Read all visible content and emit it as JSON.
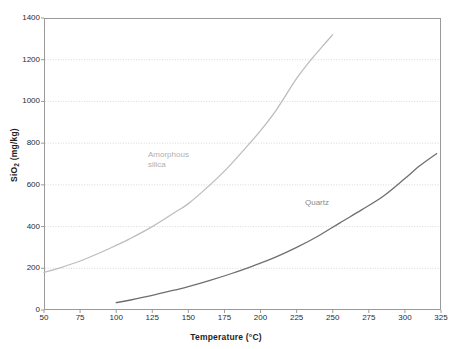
{
  "chart_data": {
    "type": "line",
    "title": "",
    "xlabel": "Temperature (°C)",
    "ylabel": "SiO2 (mg/kg)",
    "ylabel_base": "SiO",
    "ylabel_sub": "2",
    "ylabel_units": " (mg/kg)",
    "xlim": [
      50,
      325
    ],
    "ylim": [
      0,
      1400
    ],
    "xticks": [
      50,
      75,
      100,
      125,
      150,
      175,
      200,
      225,
      250,
      275,
      300,
      325
    ],
    "yticks": [
      0,
      200,
      400,
      600,
      800,
      1000,
      1200,
      1400
    ],
    "grid": "horizontal-dotted",
    "legend": "inline-annotations",
    "series": [
      {
        "name": "Amorphous silica",
        "label_text": "Amorphous\nsilica",
        "color": "#bdbdbd",
        "x": [
          50,
          60,
          75,
          90,
          100,
          109,
          125,
          141,
          150,
          165,
          177,
          190,
          200,
          211,
          225,
          235,
          243,
          250
        ],
        "y": [
          180,
          200,
          235,
          278,
          310,
          340,
          400,
          470,
          510,
          600,
          680,
          780,
          860,
          960,
          1110,
          1200,
          1265,
          1320
        ]
      },
      {
        "name": "Quartz",
        "label_text": "Quartz",
        "color": "#6f6f6f",
        "x": [
          100,
          110,
          125,
          140,
          150,
          165,
          180,
          195,
          210,
          225,
          240,
          255,
          270,
          285,
          300,
          310,
          322
        ],
        "y": [
          35,
          48,
          70,
          95,
          112,
          142,
          175,
          212,
          252,
          300,
          355,
          418,
          480,
          545,
          630,
          690,
          750
        ]
      }
    ]
  },
  "annotations": {
    "amorphous": "Amorphous\nsilica",
    "quartz": "Quartz"
  },
  "colors": {
    "amorphous_silica": "#bdbdbd",
    "quartz": "#6f6f6f",
    "frame": "#9a9a9a",
    "grid": "#d9d9d9",
    "text": "#2b2b2b",
    "background": "#ffffff"
  }
}
